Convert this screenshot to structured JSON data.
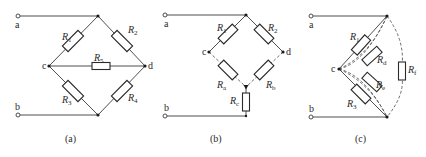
{
  "figure": {
    "panels": [
      {
        "caption": "(a)",
        "terminals": {
          "a": "a",
          "b": "b"
        },
        "nodes": {
          "c": "c",
          "d": "d"
        },
        "resistors": [
          {
            "base": "R",
            "sub": "1"
          },
          {
            "base": "R",
            "sub": "2"
          },
          {
            "base": "R",
            "sub": "5"
          },
          {
            "base": "R",
            "sub": "3"
          },
          {
            "base": "R",
            "sub": "4"
          }
        ]
      },
      {
        "caption": "(b)",
        "terminals": {
          "a": "a",
          "b": "b"
        },
        "nodes": {
          "c": "c",
          "d": "d"
        },
        "resistors": [
          {
            "base": "R",
            "sub": "1"
          },
          {
            "base": "R",
            "sub": "2"
          },
          {
            "base": "R",
            "sub": "a"
          },
          {
            "base": "R",
            "sub": "b"
          },
          {
            "base": "R",
            "sub": "c"
          }
        ]
      },
      {
        "caption": "(c)",
        "terminals": {
          "a": "a",
          "b": "b"
        },
        "nodes": {
          "c": "c"
        },
        "resistors": [
          {
            "base": "R",
            "sub": "1"
          },
          {
            "base": "R",
            "sub": "d"
          },
          {
            "base": "R",
            "sub": "e"
          },
          {
            "base": "R",
            "sub": "3"
          },
          {
            "base": "R",
            "sub": "f"
          }
        ]
      }
    ]
  }
}
